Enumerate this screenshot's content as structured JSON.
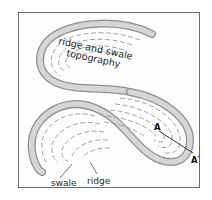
{
  "diagram": {
    "labels": {
      "title_line1": "ridge and swale",
      "title_line2": "topography",
      "swale": "swale",
      "ridge": "ridge",
      "point_a": "A",
      "point_a_prime": "A′"
    },
    "colors": {
      "frame": "#6b6b6b",
      "channel_fill": "#d6d6d6",
      "channel_edge": "#8f8f8f",
      "scroll_lines": "#9a9a9a",
      "text": "#2a2a2a",
      "section_line": "#222222"
    }
  }
}
